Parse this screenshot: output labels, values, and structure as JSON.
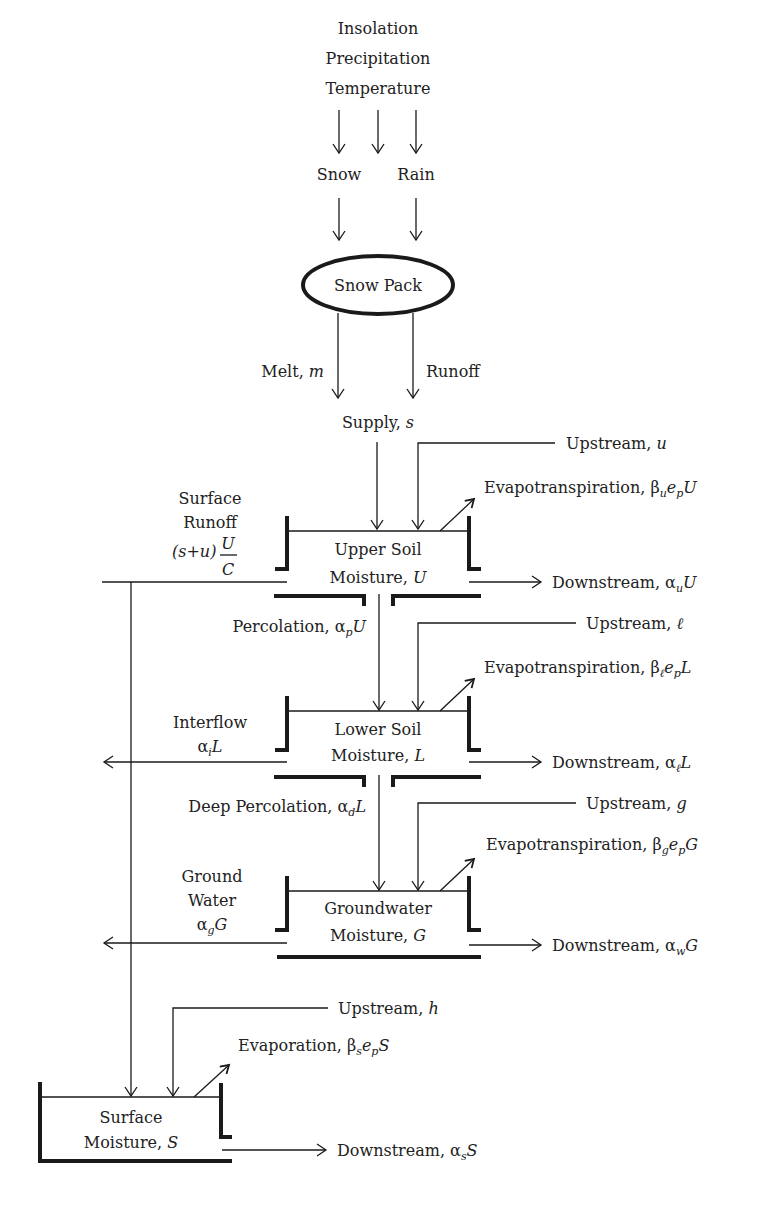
{
  "inputs": {
    "lines": [
      "Insolation",
      "Precipitation",
      "Temperature"
    ]
  },
  "precip_split": {
    "snow": "Snow",
    "rain": "Rain"
  },
  "snow_pack": {
    "label": "Snow Pack"
  },
  "snow_outputs": {
    "melt": "Melt, ",
    "melt_var": "m",
    "runoff": "Runoff"
  },
  "supply": {
    "label": "Supply, ",
    "var": "s"
  },
  "upper_soil": {
    "line1": "Upper Soil",
    "line2": "Moisture, ",
    "var": "U",
    "upstream": "Upstream, ",
    "upstream_var": "u",
    "evap": "Evapotranspiration, β",
    "evap_sub": "u",
    "evap_mid": "e",
    "evap_sub2": "p",
    "evap_end": "U",
    "downstream": "Downstream, α",
    "downstream_sub": "u",
    "downstream_end": "U",
    "surface_runoff_1": "Surface",
    "surface_runoff_2": "Runoff",
    "surface_runoff_formula": "(s+u)",
    "fraction_num": "U",
    "fraction_den": "C",
    "percolation": "Percolation, α",
    "percolation_sub": "p",
    "percolation_end": "U"
  },
  "lower_soil": {
    "line1": "Lower Soil",
    "line2": "Moisture, ",
    "var": "L",
    "upstream": "Upstream, ",
    "upstream_var": "ℓ",
    "evap": "Evapotranspiration, β",
    "evap_sub": "ℓ",
    "evap_mid": "e",
    "evap_sub2": "p",
    "evap_end": "L",
    "downstream": "Downstream, α",
    "downstream_sub": "ℓ",
    "downstream_end": "L",
    "interflow": "Interflow",
    "interflow_formula": "α",
    "interflow_sub": "i",
    "interflow_end": "L",
    "deep_percolation": "Deep Percolation, α",
    "deep_percolation_sub": "d",
    "deep_percolation_end": "L"
  },
  "groundwater": {
    "line1": "Groundwater",
    "line2": "Moisture, ",
    "var": "G",
    "upstream": "Upstream, ",
    "upstream_var": "g",
    "evap": "Evapotranspiration, β",
    "evap_sub": "g",
    "evap_mid": "e",
    "evap_sub2": "p",
    "evap_end": "G",
    "downstream": "Downstream, α",
    "downstream_sub": "w",
    "downstream_end": "G",
    "gw_1": "Ground",
    "gw_2": "Water",
    "gw_formula": "α",
    "gw_sub": "g",
    "gw_end": "G"
  },
  "surface": {
    "line1": "Surface",
    "line2": "Moisture, ",
    "var": "S",
    "upstream": "Upstream, ",
    "upstream_var": "h",
    "evap": "Evaporation, β",
    "evap_sub": "s",
    "evap_mid": "e",
    "evap_sub2": "p",
    "evap_end": "S",
    "downstream": "Downstream, α",
    "downstream_sub": "s",
    "downstream_end": "S"
  }
}
